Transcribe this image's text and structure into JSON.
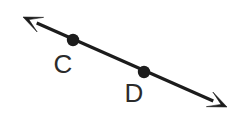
{
  "figure": {
    "type": "geometry-diagram",
    "background_color": "#ffffff",
    "stroke_color": "#1c1c1c",
    "label_color": "#2b2b2b",
    "line": {
      "name": "line-CD",
      "start_x": 23,
      "start_y": 17,
      "end_x": 227,
      "end_y": 107,
      "stroke_width": 3.2,
      "arrow_start": true,
      "arrow_end": true
    },
    "points": [
      {
        "label": "C",
        "dot_x": 73,
        "dot_y": 40,
        "dot_radius": 6.2,
        "label_x": 63,
        "label_y": 73
      },
      {
        "label": "D",
        "dot_x": 144,
        "dot_y": 72,
        "dot_radius": 6.2,
        "label_x": 134,
        "label_y": 102
      }
    ],
    "arrowheads": [
      {
        "name": "arrowhead-upper-left",
        "tip_x": 23,
        "tip_y": 17,
        "direction": "upper-left"
      },
      {
        "name": "arrowhead-lower-right",
        "tip_x": 227,
        "tip_y": 107,
        "direction": "lower-right"
      }
    ]
  }
}
